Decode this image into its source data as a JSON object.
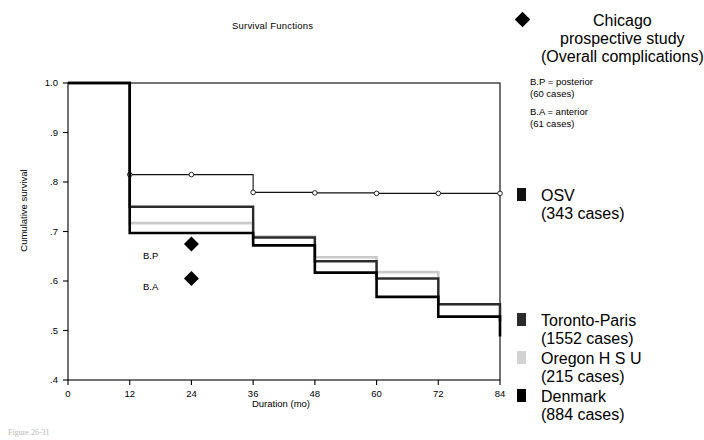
{
  "figure": {
    "title": "Survival Functions",
    "caption": "Figure 26-31"
  },
  "axes": {
    "x_title": "Duration (mo)",
    "y_title": "Cumulative survival",
    "x_ticks": [
      "0",
      "12",
      "24",
      "36",
      "48",
      "60",
      "72",
      "84"
    ],
    "y_ticks": [
      "1.0",
      ".9",
      ".8",
      ".7",
      ".6",
      ".5",
      ".4"
    ]
  },
  "annotations": [
    {
      "name": "bp-marker",
      "label": "B.P",
      "x": 24,
      "y": 0.675,
      "marker": "diamond"
    },
    {
      "name": "ba-marker",
      "label": "B.A",
      "x": 24,
      "y": 0.605,
      "marker": "diamond"
    }
  ],
  "legend": {
    "chicago": {
      "marker": "diamond",
      "color": "#000000",
      "lines": [
        "Chicago",
        "prospective study",
        "(Overall complications)"
      ]
    },
    "definitions": [
      {
        "name": "bp-definition",
        "lines": [
          "B.P  =  posterior",
          "(60 cases)"
        ]
      },
      {
        "name": "ba-definition",
        "lines": [
          "B.A  =  anterior",
          "(61 cases)"
        ]
      }
    ],
    "series": [
      {
        "name": "osv",
        "marker": "square",
        "color": "#111111",
        "lines": [
          "OSV",
          "(343 cases)"
        ]
      },
      {
        "name": "toronto-paris",
        "marker": "square",
        "color": "#2b2b2b",
        "lines": [
          "Toronto-Paris",
          "(1552 cases)"
        ]
      },
      {
        "name": "oregon-hsu",
        "marker": "square",
        "color": "#d2d2d2",
        "lines": [
          "Oregon H S U",
          "(215 cases)"
        ]
      },
      {
        "name": "denmark",
        "marker": "square",
        "color": "#000000",
        "lines": [
          "Denmark",
          "(884 cases)"
        ]
      }
    ]
  },
  "chart_data": {
    "type": "line",
    "subtype": "step-survival (Kaplan-Meier)",
    "title": "Survival Functions",
    "xlabel": "Duration (mo)",
    "ylabel": "Cumulative survival",
    "xlim": [
      0,
      84
    ],
    "ylim": [
      0.4,
      1.0
    ],
    "xticks": [
      0,
      12,
      24,
      36,
      48,
      60,
      72,
      84
    ],
    "yticks": [
      1.0,
      0.9,
      0.8,
      0.7,
      0.6,
      0.5,
      0.4
    ],
    "grid": false,
    "legend_position": "right",
    "series": [
      {
        "name": "OSV",
        "cases": 343,
        "color": "#111111",
        "width": 1.1,
        "markers": "open-circle",
        "x": [
          0,
          12,
          24,
          36,
          48,
          60,
          72,
          84
        ],
        "y": [
          1.0,
          0.815,
          0.815,
          0.779,
          0.778,
          0.777,
          0.777,
          0.777
        ]
      },
      {
        "name": "Toronto-Paris",
        "cases": 1552,
        "color": "#2b2b2b",
        "width": 2.4,
        "markers": "none",
        "x": [
          0,
          12,
          24,
          36,
          48,
          60,
          72,
          84
        ],
        "y": [
          1.0,
          0.75,
          0.75,
          0.688,
          0.64,
          0.605,
          0.553,
          0.518
        ]
      },
      {
        "name": "Oregon H S U",
        "cases": 215,
        "color": "#c9c9c9",
        "width": 2.6,
        "markers": "none",
        "x": [
          0,
          12,
          24,
          36,
          48,
          60,
          72,
          84
        ],
        "y": [
          1.0,
          0.717,
          0.717,
          0.69,
          0.648,
          0.618,
          0.553,
          0.52
        ]
      },
      {
        "name": "Denmark",
        "cases": 884,
        "color": "#000000",
        "width": 2.6,
        "markers": "none",
        "x": [
          0,
          12,
          24,
          36,
          48,
          60,
          72,
          84
        ],
        "y": [
          1.0,
          0.697,
          0.697,
          0.672,
          0.617,
          0.568,
          0.528,
          0.488
        ]
      }
    ],
    "point_annotations": [
      {
        "label": "B.P",
        "x": 24,
        "y": 0.675
      },
      {
        "label": "B.A",
        "x": 24,
        "y": 0.605
      }
    ]
  }
}
